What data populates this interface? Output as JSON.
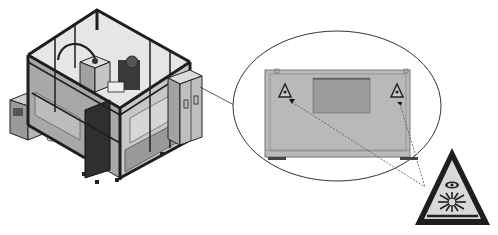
{
  "figure": {
    "machine": {
      "label": "laser-cell-enclosure",
      "components": [
        "frame-enclosure",
        "work-head",
        "cable-arm",
        "side-control-unit",
        "electrical-cabinet",
        "base-feet"
      ]
    },
    "callout": {
      "shape": "ellipse",
      "content": "enclosure-panel-with-warning-signs",
      "signs_count": 2
    },
    "warning_sign": {
      "type": "laser-radiation-warning",
      "shape": "triangle",
      "symbols": [
        "eye",
        "starburst"
      ]
    },
    "colors": {
      "frame": "#2a2a2a",
      "panel": "#b8b8b8",
      "panel_dark": "#8a8a8a",
      "window": "#9a9a9a",
      "sign_fill": "#d8d8d8",
      "line": "#444444"
    }
  }
}
